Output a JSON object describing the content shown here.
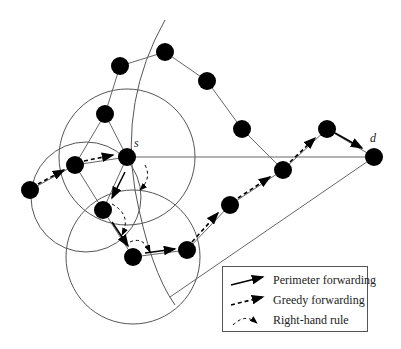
{
  "diagram": {
    "type": "GPSR routing illustration",
    "labels": {
      "source": "s",
      "destination": "d"
    },
    "nodes": [
      {
        "id": "n1",
        "x": 30,
        "y": 190
      },
      {
        "id": "n2",
        "x": 75,
        "y": 165
      },
      {
        "id": "s",
        "x": 127,
        "y": 157
      },
      {
        "id": "n4",
        "x": 103,
        "y": 210
      },
      {
        "id": "n5",
        "x": 133,
        "y": 257
      },
      {
        "id": "n6",
        "x": 187,
        "y": 250
      },
      {
        "id": "n7",
        "x": 230,
        "y": 205
      },
      {
        "id": "n8",
        "x": 283,
        "y": 170
      },
      {
        "id": "n9",
        "x": 327,
        "y": 129
      },
      {
        "id": "d",
        "x": 374,
        "y": 157
      },
      {
        "id": "u1",
        "x": 105,
        "y": 114
      },
      {
        "id": "u2",
        "x": 120,
        "y": 66
      },
      {
        "id": "u3",
        "x": 165,
        "y": 52
      },
      {
        "id": "u4",
        "x": 207,
        "y": 81
      },
      {
        "id": "u5",
        "x": 242,
        "y": 129
      }
    ],
    "edge_color": "#555555",
    "node_color": "#000000"
  },
  "legend": {
    "items": [
      {
        "label": "Perimeter forwarding",
        "style": "solid-arrow"
      },
      {
        "label": "Greedy forwarding",
        "style": "dashed-arrow"
      },
      {
        "label": "Right-hand rule",
        "style": "dashed-arc-arrow"
      }
    ]
  }
}
